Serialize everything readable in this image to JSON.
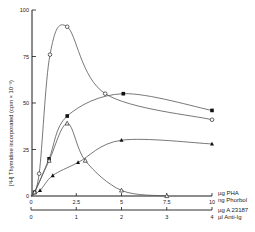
{
  "chart_data": {
    "type": "line",
    "title": "",
    "ylabel": "[³H] Thymidine incorporated (cpm × 10⁻³)",
    "xlabel_primary": "µg PHA / ng Phorbol",
    "xlabel_secondary": "µg A 23187 / µl Anti-Ig",
    "x_primary": {
      "range": [
        0,
        10
      ],
      "ticks": [
        "0",
        "2.5",
        "5",
        "7.5",
        "10"
      ],
      "unit_lines": [
        "µg PHA",
        "ng Phorbol"
      ]
    },
    "x_secondary": {
      "range": [
        0,
        4
      ],
      "ticks": [
        "0",
        "1",
        "2",
        "3",
        "4"
      ],
      "unit_lines": [
        "µg A 23187",
        "µl Anti-Ig"
      ]
    },
    "y": {
      "range": [
        0,
        100
      ],
      "ticks": [
        "0",
        "25",
        "50",
        "75",
        "100"
      ]
    },
    "grid": false,
    "series": [
      {
        "name": "open-circle",
        "marker": "circle-open",
        "points": [
          [
            0,
            0
          ],
          [
            0.45,
            12
          ],
          [
            1.05,
            76
          ],
          [
            2.0,
            91
          ],
          [
            4.1,
            55
          ],
          [
            10,
            41
          ]
        ]
      },
      {
        "name": "filled-square",
        "marker": "square-filled",
        "points": [
          [
            0,
            0
          ],
          [
            0.2,
            2
          ],
          [
            1.0,
            20
          ],
          [
            2.0,
            43
          ],
          [
            5.1,
            55
          ],
          [
            10,
            46
          ]
        ]
      },
      {
        "name": "open-triangle",
        "marker": "triangle-open",
        "points": [
          [
            0,
            0
          ],
          [
            0.2,
            2
          ],
          [
            1.0,
            19
          ],
          [
            2.0,
            39
          ],
          [
            3.0,
            19
          ],
          [
            5.0,
            3
          ],
          [
            7.5,
            0
          ]
        ]
      },
      {
        "name": "filled-triangle",
        "marker": "triangle-filled",
        "points": [
          [
            0,
            0
          ],
          [
            0.5,
            3
          ],
          [
            1.2,
            11
          ],
          [
            2.6,
            18
          ],
          [
            5.0,
            30
          ],
          [
            10,
            28
          ]
        ]
      }
    ]
  }
}
